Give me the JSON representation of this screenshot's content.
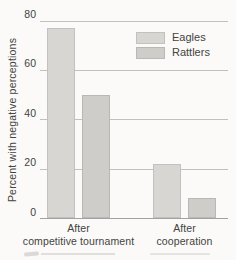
{
  "figure": {
    "background": "#fbfaf8",
    "text_color": "#434341",
    "gridline_color": "#c1c0bd",
    "baseline_color": "#a3a2a0"
  },
  "chart_data": {
    "type": "bar",
    "title": "",
    "xlabel": "",
    "ylabel": "Percent with negative perceptions",
    "categories": [
      "After competitive tournament",
      "After cooperation"
    ],
    "category_lines": [
      [
        "After",
        "competitive tournament"
      ],
      [
        "After",
        "cooperation"
      ]
    ],
    "series": [
      {
        "name": "Eagles",
        "values": [
          77,
          22
        ],
        "fill": "#d7d6d2",
        "border": "#c2c1bd"
      },
      {
        "name": "Rattlers",
        "values": [
          50,
          8
        ],
        "fill": "#cecdc9",
        "border": "#b9b8b4"
      }
    ],
    "ylim": [
      0,
      80
    ],
    "yticks": [
      0,
      20,
      40,
      60,
      80
    ],
    "grid": true,
    "legend_position": "top-right"
  }
}
